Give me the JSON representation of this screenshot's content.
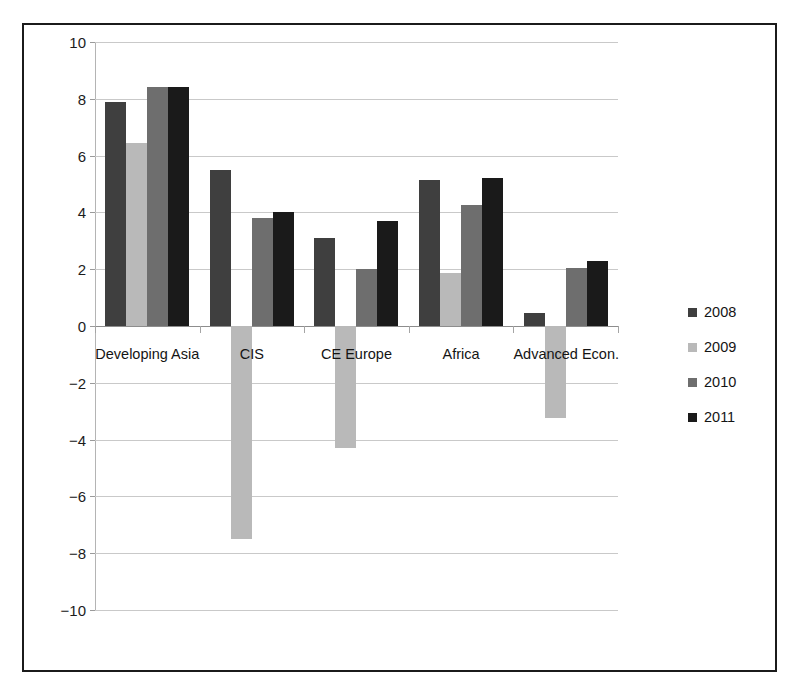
{
  "chart_data": {
    "type": "bar",
    "title": "",
    "xlabel": "",
    "ylabel": "",
    "ylim": [
      -10,
      10
    ],
    "ytick_step": 2,
    "yticks": [
      10,
      8,
      6,
      4,
      2,
      0,
      -2,
      -4,
      -6,
      -8,
      -10
    ],
    "ytick_labels": [
      "10",
      "8",
      "6",
      "4",
      "2",
      "0",
      "−2",
      "−4",
      "−6",
      "−8",
      "−10"
    ],
    "grid": true,
    "legend_position": "right",
    "categories": [
      "Developing Asia",
      "CIS",
      "CE Europe",
      "Africa",
      "Advanced Econ."
    ],
    "series": [
      {
        "name": "2008",
        "color": "#3f3f3f",
        "values": [
          7.9,
          5.5,
          3.1,
          5.15,
          0.45
        ]
      },
      {
        "name": "2009",
        "color": "#b9b9b9",
        "values": [
          6.45,
          -7.5,
          -4.3,
          1.85,
          -3.25
        ]
      },
      {
        "name": "2010",
        "color": "#6e6e6e",
        "values": [
          8.4,
          3.8,
          2.0,
          4.25,
          2.05
        ]
      },
      {
        "name": "2011",
        "color": "#1a1a1a",
        "values": [
          8.4,
          4.0,
          3.7,
          5.2,
          2.3
        ]
      }
    ]
  },
  "legend": {
    "items": [
      {
        "label": "2008",
        "color": "#3f3f3f"
      },
      {
        "label": "2009",
        "color": "#b9b9b9"
      },
      {
        "label": "2010",
        "color": "#6e6e6e"
      },
      {
        "label": "2011",
        "color": "#1a1a1a"
      }
    ]
  },
  "colors": {
    "frame": "#1b1b1b",
    "gridline": "#c9c9c9",
    "zero_line": "#8d8d8d",
    "background": "#ffffff",
    "text": "#141414"
  }
}
